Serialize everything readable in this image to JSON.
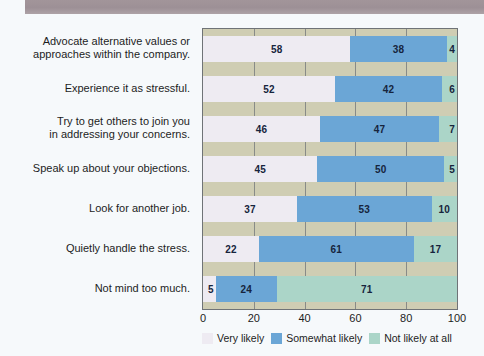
{
  "banner": {
    "name": "top-banner",
    "color": "#9d9096"
  },
  "chart_data": {
    "type": "bar",
    "orientation": "horizontal",
    "stacked": true,
    "title": "",
    "subtitle": "",
    "xlabel": "",
    "ylabel": "",
    "xlim": [
      0,
      100
    ],
    "xticks": [
      "0",
      "20",
      "40",
      "60",
      "80",
      "100"
    ],
    "grid": true,
    "legend_position": "bottom",
    "categories": [
      "Advocate alternative values or approaches within the company.",
      "Experience it as stressful.",
      "Try to get others to join you in addressing your concerns.",
      "Speak up about your objections.",
      "Look for another job.",
      "Quietly handle the stress.",
      "Not mind too much."
    ],
    "category_lines": [
      [
        "Advocate alternative values or",
        "approaches within the company."
      ],
      [
        "Experience it as stressful."
      ],
      [
        "Try to get others to join you",
        "in addressing your concerns."
      ],
      [
        "Speak up about your objections."
      ],
      [
        "Look for another job."
      ],
      [
        "Quietly handle the stress."
      ],
      [
        "Not mind too much."
      ]
    ],
    "series": [
      {
        "name": "Very likely",
        "color": "#eeebf2",
        "values": [
          58,
          52,
          46,
          45,
          37,
          22,
          5
        ]
      },
      {
        "name": "Somewhat likely",
        "color": "#6ba6d6",
        "values": [
          38,
          42,
          47,
          50,
          53,
          61,
          24
        ]
      },
      {
        "name": "Not likely at all",
        "color": "#abd5c8",
        "values": [
          4,
          6,
          7,
          5,
          10,
          17,
          71
        ]
      }
    ]
  },
  "plot": {
    "background": "#cfcdb3",
    "border_color": "#6f7377"
  }
}
